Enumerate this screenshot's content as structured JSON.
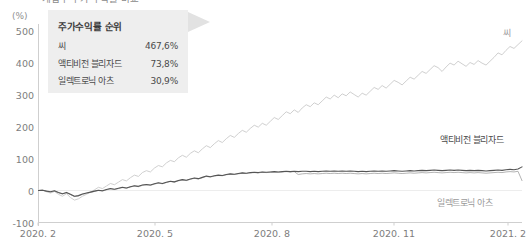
{
  "chart_title": "게임주 주가 수익률 비교",
  "axis_unit": "(%)",
  "legend": {
    "title": "주가수익률 순위",
    "rows": [
      {
        "name": "씨",
        "value": "467,6%"
      },
      {
        "name": "액티비전 블리자드",
        "value": "73,8%"
      },
      {
        "name": "일렉트로닉 아츠",
        "value": "30,9%"
      }
    ]
  },
  "series_labels": {
    "sea": "씨",
    "activision": "액티비전 블리자드",
    "ea": "일렉트로닉 아츠"
  },
  "colors": {
    "sea_line": "#c9c9c9",
    "activision_line": "#555555",
    "ea_line": "#aaaaaa",
    "axis": "#cfcfcf",
    "gridline": "#ededed",
    "legend_bg": "#eeeeee",
    "legend_tail": "#e2e2e2",
    "tick_text": "#7d7d7d"
  },
  "chart_data": {
    "type": "line",
    "title": "게임주 주가 수익률 비교",
    "xlabel": "",
    "ylabel": "(%)",
    "ylim": [
      -100,
      500
    ],
    "yticks": [
      500,
      400,
      300,
      200,
      100,
      0,
      -100
    ],
    "ytick_labels": [
      "500",
      "400",
      "300",
      "200",
      "100",
      "0",
      "-100"
    ],
    "xticks": [
      "2020. 2",
      "2020. 5",
      "2020. 8",
      "2020. 11",
      "2021. 2"
    ],
    "grid": false,
    "legend_position": "inline-right",
    "x_count": 121,
    "series": [
      {
        "name": "씨",
        "color": "#c9c9c9",
        "final_value": 467.6,
        "values": [
          0,
          2,
          -4,
          -8,
          -3,
          -12,
          -18,
          -10,
          -22,
          -30,
          -26,
          -18,
          -12,
          -5,
          2,
          10,
          6,
          14,
          22,
          18,
          26,
          34,
          30,
          40,
          48,
          44,
          56,
          62,
          58,
          70,
          78,
          74,
          86,
          94,
          90,
          102,
          110,
          104,
          116,
          124,
          118,
          130,
          140,
          134,
          146,
          156,
          150,
          162,
          172,
          166,
          178,
          188,
          182,
          194,
          204,
          198,
          210,
          204,
          216,
          228,
          222,
          234,
          246,
          240,
          252,
          244,
          258,
          268,
          262,
          274,
          268,
          280,
          292,
          286,
          298,
          290,
          302,
          296,
          308,
          300,
          292,
          304,
          298,
          310,
          322,
          316,
          328,
          320,
          332,
          344,
          338,
          330,
          342,
          354,
          348,
          360,
          372,
          366,
          378,
          390,
          384,
          372,
          386,
          398,
          392,
          404,
          396,
          388,
          400,
          394,
          406,
          398,
          392,
          404,
          416,
          430,
          424,
          438,
          450,
          444,
          456,
          467.6
        ]
      },
      {
        "name": "액티비전 블리자드",
        "color": "#555555",
        "final_value": 73.8,
        "values": [
          0,
          1,
          -2,
          -4,
          -1,
          -6,
          -10,
          -6,
          -12,
          -18,
          -16,
          -11,
          -8,
          -5,
          -2,
          1,
          -1,
          3,
          6,
          4,
          7,
          10,
          8,
          12,
          15,
          13,
          17,
          19,
          17,
          21,
          24,
          22,
          26,
          29,
          27,
          31,
          34,
          32,
          36,
          39,
          37,
          41,
          45,
          43,
          46,
          48,
          47,
          50,
          52,
          51,
          53,
          55,
          54,
          56,
          57,
          56,
          58,
          57,
          58,
          59,
          58,
          59,
          60,
          59,
          60,
          59,
          60,
          60,
          59,
          60,
          59,
          60,
          61,
          60,
          61,
          60,
          61,
          60,
          61,
          60,
          59,
          60,
          59,
          60,
          61,
          60,
          61,
          60,
          61,
          62,
          61,
          60,
          61,
          62,
          61,
          62,
          63,
          62,
          63,
          64,
          63,
          62,
          63,
          64,
          63,
          64,
          63,
          62,
          63,
          62,
          63,
          62,
          61,
          62,
          63,
          64,
          63,
          65,
          66,
          65,
          67,
          73.8
        ]
      },
      {
        "name": "일렉트로닉 아츠",
        "color": "#aaaaaa",
        "final_value": 30.9,
        "values": [
          0,
          1,
          -2,
          -5,
          -2,
          -7,
          -11,
          -7,
          -13,
          -19,
          -17,
          -12,
          -9,
          -6,
          -3,
          0,
          -2,
          2,
          5,
          3,
          6,
          9,
          7,
          11,
          14,
          12,
          16,
          18,
          16,
          20,
          23,
          21,
          25,
          28,
          26,
          30,
          33,
          31,
          35,
          38,
          36,
          40,
          44,
          42,
          45,
          47,
          46,
          49,
          51,
          50,
          52,
          54,
          53,
          55,
          56,
          55,
          57,
          56,
          57,
          58,
          57,
          58,
          59,
          58,
          59,
          50,
          52,
          53,
          52,
          53,
          52,
          53,
          54,
          53,
          54,
          53,
          54,
          53,
          54,
          53,
          52,
          53,
          52,
          53,
          54,
          53,
          54,
          53,
          54,
          55,
          54,
          53,
          54,
          55,
          54,
          55,
          56,
          55,
          56,
          57,
          56,
          55,
          56,
          57,
          56,
          57,
          56,
          55,
          56,
          55,
          56,
          55,
          54,
          55,
          56,
          57,
          56,
          58,
          59,
          58,
          60,
          30.9
        ]
      }
    ]
  }
}
